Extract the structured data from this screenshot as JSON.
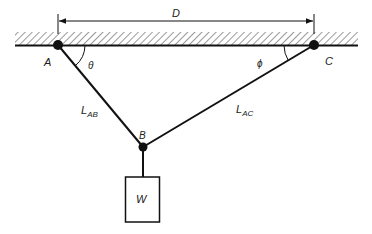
{
  "diagram": {
    "type": "statics-two-cable-suspension",
    "labels": {
      "dimension": "D",
      "point_a": "A",
      "point_b": "B",
      "point_c": "C",
      "angle_a": "θ",
      "angle_c": "ϕ",
      "cable_ab_main": "L",
      "cable_ab_sub": "AB",
      "cable_ac_main": "L",
      "cable_ac_sub": "AC",
      "weight": "W"
    },
    "colors": {
      "stroke": "#111111",
      "hatch": "#555555",
      "background": "#ffffff"
    }
  }
}
